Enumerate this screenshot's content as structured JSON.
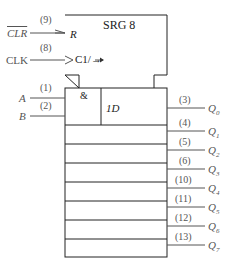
{
  "title": "SRG 8",
  "control_block": {
    "reset_label": "R",
    "clock_label": "C1/→"
  },
  "first_cell": {
    "and_symbol": "&",
    "data_label": "1D"
  },
  "inputs": [
    {
      "name": "CLR",
      "pin": "(9)",
      "inverted": true
    },
    {
      "name": "CLK",
      "pin": "(8)"
    },
    {
      "name": "A",
      "pin": "(1)"
    },
    {
      "name": "B",
      "pin": "(2)"
    }
  ],
  "outputs": [
    {
      "name": "Q",
      "sub": "0",
      "pin": "(3)"
    },
    {
      "name": "Q",
      "sub": "1",
      "pin": "(4)"
    },
    {
      "name": "Q",
      "sub": "2",
      "pin": "(5)"
    },
    {
      "name": "Q",
      "sub": "3",
      "pin": "(6)"
    },
    {
      "name": "Q",
      "sub": "4",
      "pin": "(10)"
    },
    {
      "name": "Q",
      "sub": "5",
      "pin": "(11)"
    },
    {
      "name": "Q",
      "sub": "6",
      "pin": "(12)"
    },
    {
      "name": "Q",
      "sub": "7",
      "pin": "(13)"
    }
  ]
}
